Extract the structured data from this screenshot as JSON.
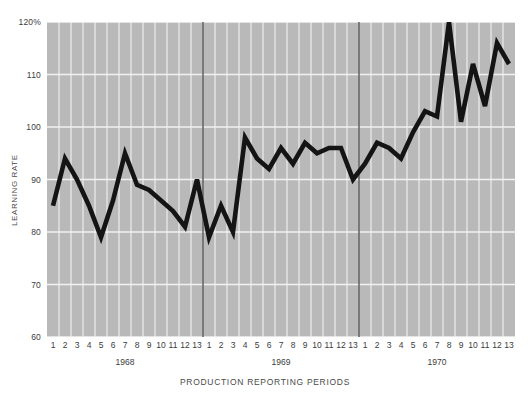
{
  "chart_data": {
    "type": "line",
    "title": "",
    "xlabel": "PRODUCTION REPORTING PERIODS",
    "ylabel": "LEARNING RATE",
    "ylim": [
      60,
      120
    ],
    "ytick_labels": [
      "120%",
      "110",
      "100",
      "90",
      "80",
      "70",
      "60"
    ],
    "ytick_values": [
      120,
      110,
      100,
      90,
      80,
      70,
      60
    ],
    "grid": true,
    "legend": "none",
    "x_tick_labels": [
      "1",
      "2",
      "3",
      "4",
      "5",
      "6",
      "7",
      "8",
      "9",
      "10",
      "11",
      "12",
      "13",
      "1",
      "2",
      "3",
      "4",
      "5",
      "6",
      "7",
      "8",
      "9",
      "10",
      "11",
      "12",
      "13",
      "1",
      "2",
      "3",
      "4",
      "5",
      "6",
      "7",
      "8",
      "9",
      "10",
      "11",
      "12",
      "13"
    ],
    "groups": [
      {
        "label": "1968",
        "start_index": 0,
        "end_index": 12
      },
      {
        "label": "1969",
        "start_index": 13,
        "end_index": 25
      },
      {
        "label": "1970",
        "start_index": 26,
        "end_index": 38
      }
    ],
    "series": [
      {
        "name": "Learning Rate",
        "values": [
          85,
          94,
          90,
          85,
          79,
          86,
          95,
          89,
          88,
          86,
          84,
          81,
          90,
          79,
          85,
          80,
          98,
          94,
          92,
          96,
          93,
          97,
          95,
          96,
          96,
          90,
          93,
          97,
          96,
          94,
          99,
          103,
          102,
          120,
          101,
          112,
          104,
          116,
          112
        ]
      }
    ],
    "colors": {
      "plot_background": "#b9b9b9",
      "gridline": "#f2f2f2",
      "series_line": "#141414",
      "year_divider": "#3a3a3a",
      "text": "#3c3c3c",
      "page_background": "#ffffff"
    }
  }
}
